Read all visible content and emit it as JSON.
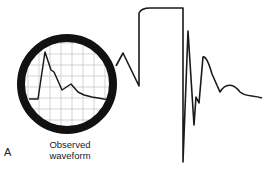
{
  "figure": {
    "panel_label": "A",
    "caption_line1": "Observed",
    "caption_line2": "waveform"
  },
  "colors": {
    "line": "#1a1a1a",
    "ring": "#111111",
    "grid": "#c8c8c8",
    "background": "#ffffff"
  },
  "magnifier": {
    "cx": 67,
    "cy": 84,
    "r": 46,
    "ring_width": 8
  },
  "waveforms": {
    "observed_inset": "29,99 38,99 45,52 51,70 54,72 62,90 71,84 78,92 84,95 92,97 104,99 112,100",
    "square_wave_trace": "116,66 123,53 139,86 139,13 C141,9 144,8 150,8 L183,8 183,162 188,31 194,125 196,97 199,103 203,57 C205,56 208,60 212,74 L220,92 C226,82 234,84 240,92 C246,97 252,95 262,98"
  }
}
